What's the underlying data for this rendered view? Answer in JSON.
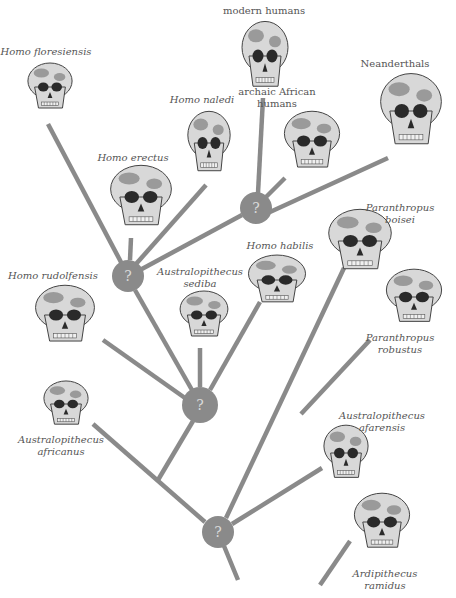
{
  "colors": {
    "branch": "#8a8a8a",
    "node_fill": "#8a8a8a",
    "node_text": "#d9d9d9",
    "label_text": "#555555",
    "skull_light": "#d8d8d8",
    "skull_mid": "#9a9a9a",
    "skull_dark": "#2a2a2a"
  },
  "node_symbol": "?",
  "nodes": [
    {
      "id": "node-a",
      "cx": 256,
      "cy": 208,
      "r": 16
    },
    {
      "id": "node-b",
      "cx": 128,
      "cy": 276,
      "r": 16
    },
    {
      "id": "node-c",
      "cx": 200,
      "cy": 405,
      "r": 18
    },
    {
      "id": "node-d",
      "cx": 218,
      "cy": 532,
      "r": 16
    }
  ],
  "species": [
    {
      "id": "homo-floresiensis",
      "label": "Homo floresiensis",
      "italic": true,
      "label_x": 46,
      "label_y": 46,
      "skull_x": 26,
      "skull_y": 62,
      "skull_w": 48,
      "skull_h": 50
    },
    {
      "id": "modern-humans",
      "label": "modern humans",
      "italic": false,
      "label_x": 264,
      "label_y": 5,
      "skull_x": 240,
      "skull_y": 20,
      "skull_w": 50,
      "skull_h": 72
    },
    {
      "id": "homo-naledi",
      "label": "Homo naledi",
      "italic": true,
      "label_x": 202,
      "label_y": 94,
      "skull_x": 186,
      "skull_y": 110,
      "skull_w": 46,
      "skull_h": 66
    },
    {
      "id": "archaic-african-humans",
      "label_lines": [
        "archaic African",
        "humans"
      ],
      "italic": false,
      "label_x": 277,
      "label_y": 86,
      "skull_x": 282,
      "skull_y": 110,
      "skull_w": 60,
      "skull_h": 62
    },
    {
      "id": "neanderthals",
      "label": "Neanderthals",
      "italic": false,
      "label_x": 395,
      "label_y": 58,
      "skull_x": 378,
      "skull_y": 72,
      "skull_w": 66,
      "skull_h": 78
    },
    {
      "id": "homo-erectus",
      "label": "Homo erectus",
      "italic": true,
      "label_x": 133,
      "label_y": 152,
      "skull_x": 108,
      "skull_y": 164,
      "skull_w": 66,
      "skull_h": 66
    },
    {
      "id": "homo-rudolfensis",
      "label": "Homo rudolfensis",
      "italic": true,
      "label_x": 53,
      "label_y": 270,
      "skull_x": 33,
      "skull_y": 284,
      "skull_w": 64,
      "skull_h": 62
    },
    {
      "id": "australopithecus-sediba",
      "label_lines": [
        "Australopithecus",
        "sediba"
      ],
      "italic": true,
      "label_x": 200,
      "label_y": 266,
      "skull_x": 178,
      "skull_y": 290,
      "skull_w": 52,
      "skull_h": 50
    },
    {
      "id": "homo-habilis",
      "label": "Homo habilis",
      "italic": true,
      "label_x": 280,
      "label_y": 240,
      "skull_x": 246,
      "skull_y": 254,
      "skull_w": 62,
      "skull_h": 52
    },
    {
      "id": "paranthropus-boisei",
      "label_lines": [
        "Paranthropus",
        "boisei"
      ],
      "italic": true,
      "label_x": 400,
      "label_y": 202,
      "skull_x": 326,
      "skull_y": 208,
      "skull_w": 68,
      "skull_h": 66
    },
    {
      "id": "paranthropus-robustus",
      "label_lines": [
        "Paranthropus",
        "robustus"
      ],
      "italic": true,
      "label_x": 400,
      "label_y": 332,
      "skull_x": 384,
      "skull_y": 268,
      "skull_w": 60,
      "skull_h": 58
    },
    {
      "id": "australopithecus-africanus",
      "label_lines": [
        "Australopithecus",
        "africanus"
      ],
      "italic": true,
      "label_x": 61,
      "label_y": 434,
      "skull_x": 42,
      "skull_y": 380,
      "skull_w": 48,
      "skull_h": 48
    },
    {
      "id": "australopithecus-afarensis",
      "label_lines": [
        "Australopithecus",
        "afarensis"
      ],
      "italic": true,
      "label_x": 382,
      "label_y": 410,
      "skull_x": 322,
      "skull_y": 424,
      "skull_w": 48,
      "skull_h": 58
    },
    {
      "id": "ardipithecus-ramidus",
      "label_lines": [
        "Ardipithecus",
        "ramidus"
      ],
      "italic": true,
      "label_x": 385,
      "label_y": 568,
      "skull_x": 352,
      "skull_y": 492,
      "skull_w": 60,
      "skull_h": 60
    }
  ],
  "branches": [
    {
      "id": "branch-floresiensis",
      "x1": 48,
      "y1": 124,
      "x2": 122,
      "y2": 264
    },
    {
      "id": "branch-erectus",
      "x1": 131,
      "y1": 238,
      "x2": 130,
      "y2": 260
    },
    {
      "id": "branch-naledi",
      "x1": 206,
      "y1": 185,
      "x2": 136,
      "y2": 264
    },
    {
      "id": "branch-b-to-a",
      "x1": 140,
      "y1": 270,
      "x2": 242,
      "y2": 215
    },
    {
      "id": "branch-modern-humans",
      "x1": 263,
      "y1": 98,
      "x2": 258,
      "y2": 193
    },
    {
      "id": "branch-archaic",
      "x1": 285,
      "y1": 178,
      "x2": 266,
      "y2": 197
    },
    {
      "id": "branch-neanderthals",
      "x1": 388,
      "y1": 158,
      "x2": 270,
      "y2": 212
    },
    {
      "id": "branch-b-to-c",
      "x1": 135,
      "y1": 290,
      "x2": 192,
      "y2": 390
    },
    {
      "id": "branch-rudolfensis",
      "x1": 103,
      "y1": 340,
      "x2": 185,
      "y2": 398
    },
    {
      "id": "branch-sediba",
      "x1": 200,
      "y1": 348,
      "x2": 200,
      "y2": 387
    },
    {
      "id": "branch-habilis",
      "x1": 260,
      "y1": 302,
      "x2": 210,
      "y2": 390
    },
    {
      "id": "branch-c-down",
      "x1": 193,
      "y1": 421,
      "x2": 158,
      "y2": 480
    },
    {
      "id": "branch-africanus",
      "x1": 93,
      "y1": 424,
      "x2": 205,
      "y2": 522
    },
    {
      "id": "branch-boisei",
      "x1": 344,
      "y1": 268,
      "x2": 226,
      "y2": 518
    },
    {
      "id": "branch-robustus",
      "x1": 370,
      "y1": 340,
      "x2": 301,
      "y2": 414
    },
    {
      "id": "branch-afarensis",
      "x1": 322,
      "y1": 468,
      "x2": 232,
      "y2": 524
    },
    {
      "id": "branch-root",
      "x1": 224,
      "y1": 546,
      "x2": 238,
      "y2": 580
    },
    {
      "id": "branch-ramidus",
      "x1": 350,
      "y1": 541,
      "x2": 320,
      "y2": 585
    }
  ]
}
